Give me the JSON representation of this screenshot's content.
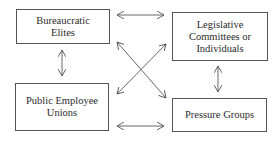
{
  "diagram": {
    "nodes": [
      {
        "id": "bureaucratic-elites",
        "label": "Bureaucratic Elites"
      },
      {
        "id": "legislative",
        "label": "Legislative Committees or Individuals"
      },
      {
        "id": "public-employee-unions",
        "label": "Public Employee Unions"
      },
      {
        "id": "pressure-groups",
        "label": "Pressure Groups"
      }
    ],
    "edges": [
      {
        "from": "bureaucratic-elites",
        "to": "legislative",
        "type": "bidirectional"
      },
      {
        "from": "bureaucratic-elites",
        "to": "public-employee-unions",
        "type": "bidirectional"
      },
      {
        "from": "bureaucratic-elites",
        "to": "pressure-groups",
        "type": "bidirectional"
      },
      {
        "from": "legislative",
        "to": "public-employee-unions",
        "type": "bidirectional"
      },
      {
        "from": "legislative",
        "to": "pressure-groups",
        "type": "bidirectional"
      },
      {
        "from": "public-employee-unions",
        "to": "pressure-groups",
        "type": "bidirectional"
      }
    ]
  },
  "labels": {
    "bureaucratic_1": "Bureaucratic",
    "bureaucratic_2": "Elites",
    "legislative_1": "Legislative",
    "legislative_2": "Committees or",
    "legislative_3": "Individuals",
    "unions_1": "Public Employee",
    "unions_2": "Unions",
    "pressure": "Pressure Groups"
  }
}
